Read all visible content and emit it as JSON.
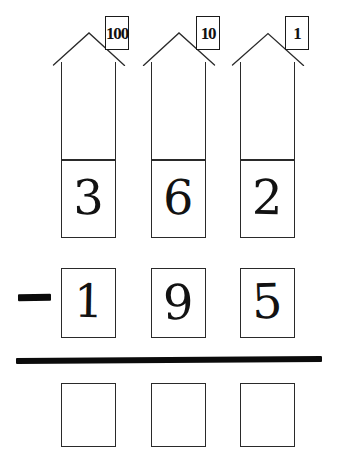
{
  "worksheet": {
    "type": "place-value-subtraction",
    "operator": "−",
    "columns": [
      {
        "place": "hundreds",
        "place_label": "100",
        "minuend_digit": "3",
        "subtrahend_digit": "1",
        "answer_digit": ""
      },
      {
        "place": "tens",
        "place_label": "10",
        "minuend_digit": "6",
        "subtrahend_digit": "9",
        "answer_digit": ""
      },
      {
        "place": "ones",
        "place_label": "1",
        "minuend_digit": "2",
        "subtrahend_digit": "5",
        "answer_digit": ""
      }
    ],
    "minuend": "362",
    "subtrahend": "195",
    "answer": "",
    "colors": {
      "ink": "#1a1a1a",
      "line": "#2a2a2a",
      "heavy": "#0b0b0b",
      "paper": "#ffffff"
    }
  }
}
